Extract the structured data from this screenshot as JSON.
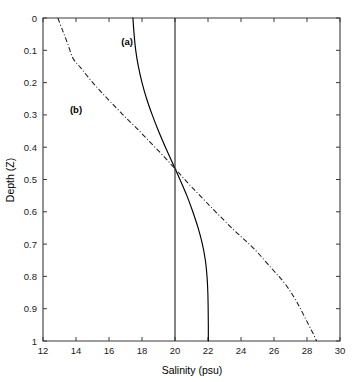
{
  "chart_data": {
    "type": "line",
    "title": "",
    "xlabel": "Salinity (psu)",
    "ylabel": "Depth (Z)",
    "xlim": [
      12,
      30
    ],
    "ylim": [
      0,
      1
    ],
    "y_inverted": true,
    "grid": false,
    "legend_position": "inline-annotations",
    "xticks": [
      12,
      14,
      16,
      18,
      20,
      22,
      24,
      26,
      28,
      30
    ],
    "xtick_labels": [
      "12",
      "14",
      "16",
      "18",
      "20",
      "22",
      "24",
      "26",
      "28",
      "30"
    ],
    "yticks": [
      0,
      0.1,
      0.2,
      0.3,
      0.4,
      0.5,
      0.6,
      0.7,
      0.8,
      0.9,
      1
    ],
    "ytick_labels": [
      "0",
      "0.1",
      "0.2",
      "0.3",
      "0.4",
      "0.5",
      "0.6",
      "0.7",
      "0.8",
      "0.9",
      "1"
    ],
    "annotations": [
      {
        "text": "(a)",
        "x": 17.1,
        "y": 0.085
      },
      {
        "text": "(b)",
        "x": 14.0,
        "y": 0.295
      }
    ],
    "series": [
      {
        "name": "(a)",
        "style": "solid",
        "color": "#000000",
        "x": [
          17.45,
          17.52,
          17.62,
          17.78,
          18.0,
          18.28,
          18.62,
          19.0,
          19.42,
          19.86,
          20.3,
          20.72,
          21.08,
          21.4,
          21.66,
          21.84,
          21.94,
          21.99,
          22.01,
          22.02,
          22.02
        ],
        "y": [
          0.0,
          0.05,
          0.1,
          0.15,
          0.2,
          0.25,
          0.3,
          0.35,
          0.4,
          0.45,
          0.5,
          0.55,
          0.6,
          0.65,
          0.7,
          0.75,
          0.8,
          0.85,
          0.9,
          0.95,
          1.0
        ]
      },
      {
        "name": "(b)",
        "style": "dash-dot",
        "color": "#1a1a1a",
        "x": [
          12.9,
          13.2,
          13.5,
          13.82,
          14.3,
          14.85,
          15.45,
          16.1,
          16.85,
          17.65,
          18.5,
          19.35,
          20.15,
          20.95,
          21.8,
          22.75,
          23.75,
          24.8,
          25.85,
          26.55,
          27.1,
          27.55,
          27.95,
          28.25,
          28.45,
          28.58
        ],
        "y": [
          0.0,
          0.04,
          0.08,
          0.125,
          0.155,
          0.19,
          0.225,
          0.26,
          0.3,
          0.34,
          0.385,
          0.43,
          0.475,
          0.52,
          0.565,
          0.615,
          0.665,
          0.715,
          0.775,
          0.815,
          0.855,
          0.895,
          0.935,
          0.965,
          0.985,
          1.0
        ]
      },
      {
        "name": "reference",
        "style": "solid",
        "color": "#2b2b2b",
        "x": [
          20.0,
          20.0
        ],
        "y": [
          0.0,
          1.0
        ]
      }
    ]
  }
}
